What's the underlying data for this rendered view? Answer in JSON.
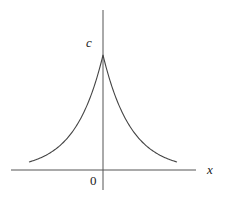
{
  "chart_data": {
    "type": "line",
    "title": "",
    "xlabel": "x",
    "ylabel": "",
    "function": "y = c * exp(-|x|)",
    "annotations": [
      {
        "text": "c",
        "position": "peak value on y-axis"
      },
      {
        "text": "0",
        "position": "origin"
      }
    ],
    "x": [
      -3,
      -2.5,
      -2,
      -1.5,
      -1,
      -0.5,
      0,
      0.5,
      1,
      1.5,
      2,
      2.5,
      3
    ],
    "series": [
      {
        "name": "c e^{-|x|}",
        "values": [
          0.05,
          0.08,
          0.14,
          0.22,
          0.37,
          0.61,
          1.0,
          0.61,
          0.37,
          0.22,
          0.14,
          0.08,
          0.05
        ]
      }
    ],
    "peak_label": "c",
    "grid": false,
    "legend": "none"
  },
  "labels": {
    "y_peak": "c",
    "x_axis": "x",
    "origin": "0"
  }
}
